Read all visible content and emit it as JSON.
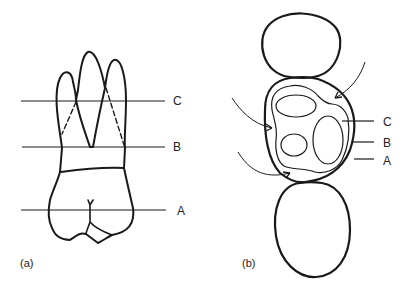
{
  "panel_a": {
    "caption": "(a)",
    "levels": [
      {
        "label": "C",
        "y": 101
      },
      {
        "label": "B",
        "y": 147
      },
      {
        "label": "A",
        "y": 210
      }
    ]
  },
  "panel_b": {
    "caption": "(b)",
    "labels": [
      {
        "label": "C"
      },
      {
        "label": "B"
      },
      {
        "label": "A"
      }
    ]
  }
}
